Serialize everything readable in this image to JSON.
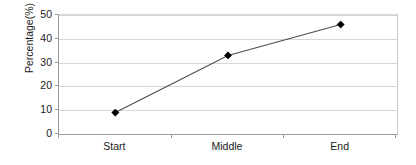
{
  "chart_data": {
    "type": "line",
    "title": "",
    "xlabel": "",
    "ylabel": "Percentage(%)",
    "categories": [
      "Start",
      "Middle",
      "End"
    ],
    "values": [
      9,
      33,
      46
    ],
    "series": [
      {
        "name": "Percentage",
        "values": [
          9,
          33,
          46
        ]
      }
    ],
    "ylim": [
      0,
      50
    ],
    "yticks": [
      0,
      10,
      20,
      30,
      40,
      50
    ],
    "ytick_labels": [
      "0",
      "10",
      "20",
      "30",
      "40",
      "50"
    ],
    "grid": true,
    "legend": "none",
    "marker": "diamond",
    "line_color": "#4d4d4d",
    "marker_color": "#000000",
    "gridline_color": "#d6d6d6",
    "axis_color": "#9a9a9a",
    "background_color": "#ffffff",
    "text_color": "#1a1a1a"
  },
  "axes": {
    "y_title": "Percentage(%)",
    "y_tick_labels": [
      "50",
      "40",
      "30",
      "20",
      "10",
      "0"
    ],
    "x_tick_labels": [
      "Start",
      "Middle",
      "End"
    ]
  }
}
